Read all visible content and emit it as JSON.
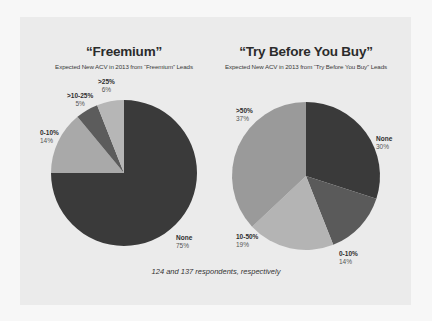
{
  "chart_data": [
    {
      "type": "pie",
      "title": "“Freemium”",
      "subtitle": "Expected New ACV in 2013 from “Freemium” Leads",
      "categories": [
        "None",
        "0-10%",
        ">10-25%",
        ">25%"
      ],
      "values": [
        75,
        14,
        5,
        6
      ],
      "value_labels": [
        "75%",
        "14%",
        "5%",
        "6%"
      ],
      "colors": [
        "#3a3a3a",
        "#a9a9a9",
        "#5c5c5c",
        "#b6b6b6"
      ],
      "start_angle": "12 o'clock",
      "direction": "clockwise",
      "respondents": 124
    },
    {
      "type": "pie",
      "title": "“Try Before You Buy”",
      "subtitle": "Expected New ACV in 2013 from “Try Before You Buy” Leads",
      "categories": [
        "None",
        "0-10%",
        "10-50%",
        ">50%"
      ],
      "values": [
        30,
        14,
        19,
        37
      ],
      "value_labels": [
        "30%",
        "14%",
        "19%",
        "37%"
      ],
      "colors": [
        "#3a3a3a",
        "#5a5a5a",
        "#b4b4b4",
        "#9a9a9a"
      ],
      "start_angle": "12 o'clock",
      "direction": "clockwise",
      "respondents": 137
    }
  ],
  "left": {
    "title": "“Freemium”",
    "subtitle": "Expected New ACV in 2013 from “Freemium” Leads",
    "labels": [
      {
        "name": "None",
        "value": "75%"
      },
      {
        "name": "0-10%",
        "value": "14%"
      },
      {
        "name": ">10-25%",
        "value": "5%"
      },
      {
        "name": ">25%",
        "value": "6%"
      }
    ]
  },
  "right": {
    "title": "“Try Before You Buy”",
    "subtitle": "Expected New ACV in 2013 from “Try Before You Buy” Leads",
    "labels": [
      {
        "name": "None",
        "value": "30%"
      },
      {
        "name": "0-10%",
        "value": "14%"
      },
      {
        "name": "10-50%",
        "value": "19%"
      },
      {
        "name": ">50%",
        "value": "37%"
      }
    ]
  },
  "footnote": "124 and 137 respondents, respectively"
}
